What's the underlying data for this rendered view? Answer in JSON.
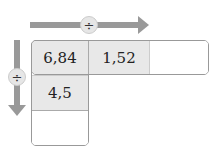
{
  "operators": {
    "horizontal": "÷",
    "vertical": "÷"
  },
  "grid": {
    "row": [
      {
        "value": "6,84"
      },
      {
        "value": "1,52"
      },
      {
        "value": ""
      }
    ],
    "column": [
      {
        "value": "6,84"
      },
      {
        "value": "4,5"
      },
      {
        "value": ""
      }
    ]
  },
  "colors": {
    "arrow": "#999999",
    "filled_cell": "#e8e8e8",
    "empty_cell": "#ffffff"
  }
}
